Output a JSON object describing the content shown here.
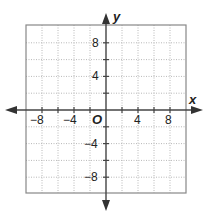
{
  "chart_data": {
    "type": "coordinate-plane",
    "title": "",
    "xlabel": "x",
    "ylabel": "y",
    "origin_label": "O",
    "xlim": [
      -10,
      10
    ],
    "ylim": [
      -10,
      10
    ],
    "grid": true,
    "grid_step": 2,
    "x_tick_labels": [
      "-8",
      "-4",
      "4",
      "8"
    ],
    "y_tick_labels": [
      "8",
      "4",
      "-4",
      "-8"
    ],
    "x_tick_values": [
      -8,
      -4,
      4,
      8
    ],
    "y_tick_values": [
      8,
      4,
      -4,
      -8
    ],
    "points": []
  },
  "labels": {
    "x_axis": "x",
    "y_axis": "y",
    "origin": "O",
    "x_ticks": [
      "−8",
      "−4",
      "4",
      "8"
    ],
    "y_ticks": [
      "8",
      "4",
      "−4",
      "−8"
    ]
  },
  "colors": {
    "axis": "#444444",
    "grid": "#b8b8b8",
    "border": "#888888",
    "text": "#222222"
  }
}
